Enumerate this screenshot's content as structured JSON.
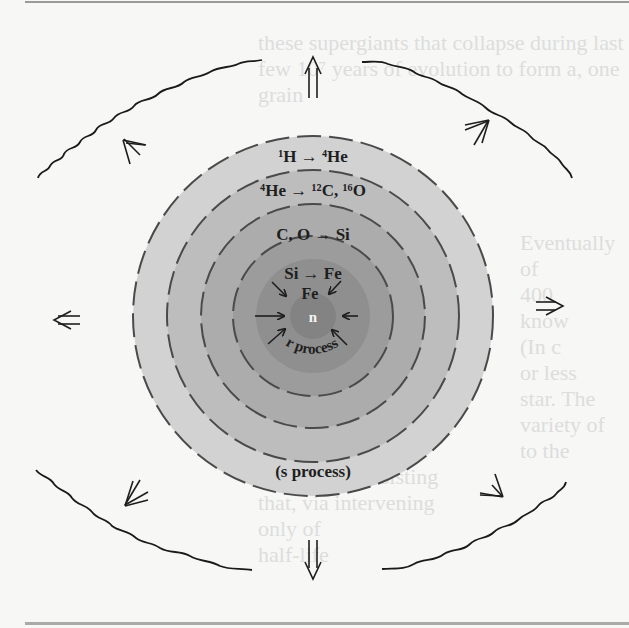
{
  "figure": {
    "shells": [
      {
        "id": "shell-h-burning",
        "label": "¹H → ⁴He",
        "radius": 180,
        "fill": "#d2d2d2"
      },
      {
        "id": "shell-he-burning",
        "label": "⁴He → ¹²C, ¹⁶O",
        "radius": 146,
        "fill": "#bdbdbd"
      },
      {
        "id": "shell-c-o-burning",
        "label": "C, O → Si",
        "radius": 112,
        "fill": "#acacac"
      },
      {
        "id": "shell-si-burning",
        "label": "Si → Fe",
        "radius": 80,
        "fill": "#9c9c9c"
      },
      {
        "id": "shell-fe-core",
        "label": "Fe",
        "radius": 57,
        "fill": "#8f8f8f"
      },
      {
        "id": "neutron-core",
        "label": "n",
        "radius": 23,
        "fill": "#838383"
      }
    ],
    "annotations": {
      "r_process": "r process",
      "s_process": "(s process)"
    },
    "outflow_arrows": 8,
    "infall_arrows": 6,
    "shock_fronts": 4,
    "colors": {
      "outer_shell": "#d2d2d2",
      "core": "#838383",
      "line": "#2a2a2a",
      "background": "#f7f7f6"
    }
  },
  "background_text": [
    "these supergiants that collapse during last",
    "few 10⁷ years of evolution to form a, one",
    "grain",
    "10.3.4.2",
    "Eventually",
    "of",
    "400",
    "know",
    "(In c",
    "or less",
    "star. The",
    "variety of",
    "to the",
    "originally consisting",
    "that, via intervening",
    "only of",
    "half-life"
  ]
}
